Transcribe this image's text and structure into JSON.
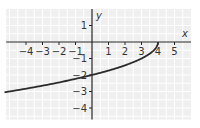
{
  "chart_data": {
    "type": "line",
    "title": "",
    "xlabel": "x",
    "ylabel": "y",
    "xlim": [
      -5.2,
      6
    ],
    "ylim": [
      -4.7,
      2
    ],
    "grid": true,
    "x_ticks": [
      "-4",
      "-3",
      "-2",
      "-1",
      "1",
      "2",
      "3",
      "4",
      "5"
    ],
    "y_ticks": [
      "1",
      "-1",
      "-2",
      "-3",
      "-4"
    ],
    "series": [
      {
        "name": "y = -sqrt(4 - x)",
        "equation": "x = 4 - y^2, y <= 0",
        "x": [
          -5,
          -4,
          -3,
          -2,
          -1,
          0,
          1,
          2,
          3,
          3.75,
          4
        ],
        "values": [
          -3,
          -2.83,
          -2.65,
          -2.45,
          -2.24,
          -2,
          -1.73,
          -1.41,
          -1,
          -0.5,
          0
        ]
      }
    ]
  },
  "colors": {
    "grid_bg": "#efefef",
    "grid_line": "#ffffff",
    "axis": "#222222",
    "curve": "#2b2b2b"
  }
}
